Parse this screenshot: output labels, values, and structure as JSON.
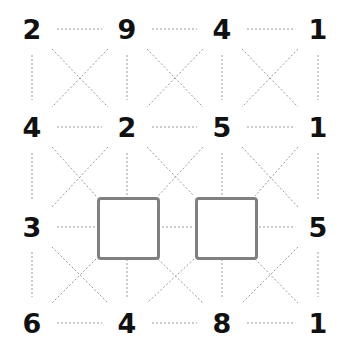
{
  "puzzle": {
    "grid_size": 4,
    "columns_x": [
      32,
      127,
      222,
      318
    ],
    "rows_y": [
      29,
      127,
      227,
      323
    ],
    "cells": [
      [
        "2",
        "9",
        "4",
        "1"
      ],
      [
        "4",
        "2",
        "5",
        "1"
      ],
      [
        "3",
        "",
        "",
        "5"
      ],
      [
        "6",
        "4",
        "8",
        "1"
      ]
    ],
    "empty_cells": [
      [
        2,
        1
      ],
      [
        2,
        2
      ]
    ],
    "line_color": "#9a9a9a",
    "box_border_color": "#808080"
  }
}
